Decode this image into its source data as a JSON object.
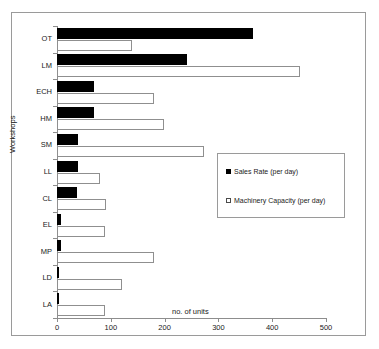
{
  "chart_data": {
    "type": "bar",
    "orientation": "horizontal",
    "title": "",
    "xlabel": "no. of units",
    "ylabel": "Workshops",
    "xlim": [
      0,
      500
    ],
    "xticks": [
      0,
      100,
      200,
      300,
      400,
      500
    ],
    "grid": false,
    "legend_position": "middle-right",
    "categories": [
      "OT",
      "LM",
      "ECH",
      "HM",
      "SM",
      "LL",
      "CL",
      "EL",
      "MP",
      "LD",
      "LA"
    ],
    "series": [
      {
        "name": "Sales Rate (per day)",
        "color": "#000000",
        "style": "filled",
        "values": [
          364,
          242,
          69,
          69,
          39,
          39,
          37,
          8,
          8,
          4,
          4
        ]
      },
      {
        "name": "Machinery Capacity (per day)",
        "color": "#ffffff",
        "style": "outlined",
        "values": [
          139,
          452,
          180,
          199,
          273,
          80,
          91,
          90,
          180,
          120,
          90
        ]
      }
    ]
  },
  "axes": {
    "y_title": "Workshops",
    "x_title": "no. of units",
    "x_tick_labels": [
      "0",
      "100",
      "200",
      "300",
      "400",
      "500"
    ],
    "y_tick_labels": [
      "OT",
      "LM",
      "ECH",
      "HM",
      "SM",
      "LL",
      "CL",
      "EL",
      "MP",
      "LD",
      "LA"
    ]
  },
  "legend": {
    "items": [
      {
        "label": "Sales Rate (per day)",
        "swatch": "filled-square-black"
      },
      {
        "label": "Machinery Capacity (per day)",
        "swatch": "open-square-white"
      }
    ]
  }
}
